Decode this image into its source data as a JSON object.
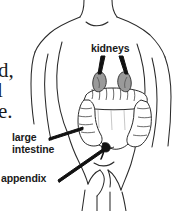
{
  "figure": {
    "background_color": "#ffffff",
    "outline_color": "#2b2b2b",
    "label_color": "#1a1a1a",
    "kidney_fill_color": "#9a9a9a",
    "appendix_color": "#111111",
    "leader_line_color": "#111111"
  },
  "labels": {
    "kidneys": "kidneys",
    "large_intestine_line1": "large",
    "large_intestine_line2": "intestine",
    "appendix": "appendix"
  },
  "body_text_fragments": [
    "d,",
    "l",
    "e."
  ],
  "organs": [
    {
      "name": "kidneys",
      "label": "kidneys",
      "count": 2,
      "shading": "gray"
    },
    {
      "name": "large-intestine",
      "label": "large intestine",
      "count": 1,
      "shading": "outline"
    },
    {
      "name": "appendix",
      "label": "appendix",
      "count": 1,
      "shading": "solid-dark"
    }
  ]
}
